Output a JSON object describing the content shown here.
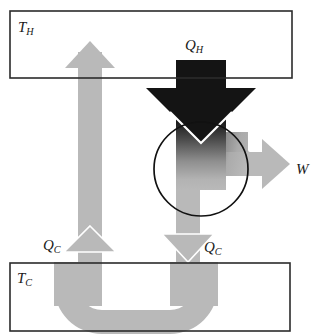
{
  "figure": {
    "type": "thermodynamic-flow-diagram"
  },
  "colors": {
    "hot_flow": "#b9b9b9",
    "cold_flow": "#b9b9b9",
    "heat_in_dark": "#1a1a1a",
    "work_flow": "#b9b9b9",
    "border": "#2b2b2b",
    "background": "#ffffff",
    "text": "#1a1a1a"
  },
  "reservoirs": {
    "hot": {
      "name": "hot-reservoir",
      "symbol": "T",
      "subscript": "H",
      "box": {
        "x": 10,
        "y": 11,
        "width": 282,
        "height": 67
      }
    },
    "cold": {
      "name": "cold-reservoir",
      "symbol": "T",
      "subscript": "C",
      "box": {
        "x": 10,
        "y": 263,
        "width": 280,
        "height": 68
      }
    }
  },
  "engine": {
    "name": "engine-circle",
    "cx": 201,
    "cy": 169,
    "r": 47
  },
  "flows": {
    "heat_in": {
      "name": "heat-in-arrow",
      "symbol": "Q",
      "subscript": "H",
      "direction": "down",
      "shade": "black"
    },
    "heat_out_left": {
      "name": "heat-out-arrow-left",
      "symbol": "Q",
      "subscript": "C",
      "direction": "up",
      "shade": "gray"
    },
    "heat_out_right": {
      "name": "heat-out-arrow-right",
      "symbol": "Q",
      "subscript": "C",
      "direction": "down",
      "shade": "gray"
    },
    "work": {
      "name": "work-arrow",
      "symbol": "W",
      "subscript": "",
      "direction": "right",
      "shade": "gray"
    }
  }
}
